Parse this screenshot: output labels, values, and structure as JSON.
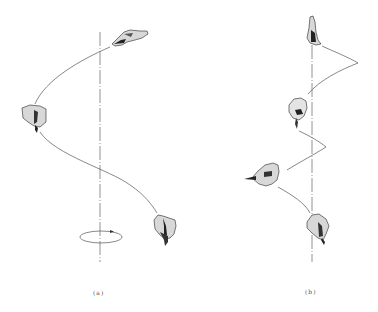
{
  "figure": {
    "panels": [
      {
        "id": "a",
        "label": "(a)",
        "description": "Tooth rotating around vertical axis along a helical path, with rotation indicator ellipse at bottom"
      },
      {
        "id": "b",
        "label": "(b)",
        "description": "Tooth following a tighter zig-zag helical path around vertical axis"
      }
    ],
    "colors": {
      "line": "#555555",
      "axis": "#777777",
      "tooth_fill": "#d8d8d8",
      "tooth_shade": "#222222",
      "background": "#ffffff"
    }
  }
}
